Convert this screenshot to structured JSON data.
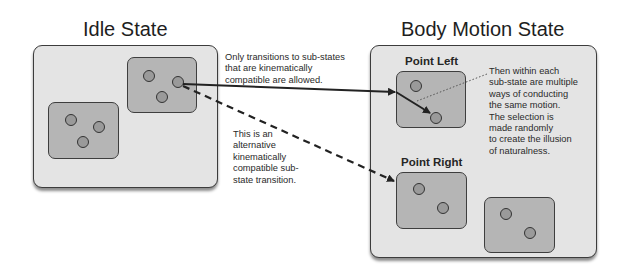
{
  "diagram": {
    "idle_state": {
      "title": "Idle State",
      "substates": [
        {
          "id": "idle-sub-top",
          "dots": 3
        },
        {
          "id": "idle-sub-bottom",
          "dots": 3
        }
      ]
    },
    "body_motion_state": {
      "title": "Body Motion State",
      "substates": [
        {
          "id": "point-left",
          "label": "Point Left",
          "dots": 2
        },
        {
          "id": "point-right",
          "label": "Point Right",
          "dots": 2
        },
        {
          "id": "unlabeled",
          "label": "",
          "dots": 2
        }
      ]
    },
    "annotations": {
      "allowed_transitions": [
        "Only transitions to sub-states",
        "that are kinematically",
        "compatible are allowed."
      ],
      "alternative_transition": [
        "This is an",
        "alternative",
        "kinematically",
        "compatible sub-",
        "state transition."
      ],
      "within_substate": [
        "Then within each",
        "sub-state are multiple",
        "ways of conducting",
        "the same motion.",
        "The selection is",
        "made randomly",
        "to create the illusion",
        "of naturalness."
      ]
    },
    "edges": [
      {
        "from": "idle-sub-top",
        "to": "point-left",
        "style": "solid",
        "meaning": "allowed transition"
      },
      {
        "from": "idle-sub-top",
        "to": "point-right",
        "style": "dashed",
        "meaning": "alternative transition"
      },
      {
        "from": "point-left-entry",
        "to": "point-left-dot-2",
        "style": "solid",
        "meaning": "intra-substate motion"
      },
      {
        "from": "within_substate-note",
        "to": "point-left",
        "style": "dotted",
        "meaning": "annotation leader"
      }
    ],
    "colors": {
      "outer_panel": "#e4e4e4",
      "inner_panel": "#b5b5b5",
      "dot_fill": "#9a9a9a",
      "stroke": "#333333"
    }
  }
}
